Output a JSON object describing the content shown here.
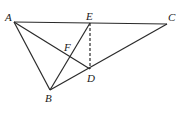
{
  "diagram": {
    "type": "geometry",
    "stroke_color": "#2a2a2a",
    "points": {
      "A": {
        "label": "A",
        "x": 14,
        "y": 22
      },
      "E": {
        "label": "E",
        "x": 90,
        "y": 23
      },
      "C": {
        "label": "C",
        "x": 167,
        "y": 24
      },
      "F": {
        "label": "F",
        "x": 71,
        "y": 58
      },
      "D": {
        "label": "D",
        "x": 90,
        "y": 69
      },
      "B": {
        "label": "B",
        "x": 50,
        "y": 90
      }
    },
    "segments": [
      {
        "from": "A",
        "to": "C",
        "style": "solid"
      },
      {
        "from": "A",
        "to": "B",
        "style": "solid"
      },
      {
        "from": "A",
        "to": "D",
        "style": "solid"
      },
      {
        "from": "B",
        "to": "C",
        "style": "solid"
      },
      {
        "from": "B",
        "to": "E",
        "style": "solid"
      },
      {
        "from": "E",
        "to": "D",
        "style": "dashed"
      }
    ],
    "labels": {
      "A": "A",
      "B": "B",
      "C": "C",
      "D": "D",
      "E": "E",
      "F": "F"
    }
  }
}
